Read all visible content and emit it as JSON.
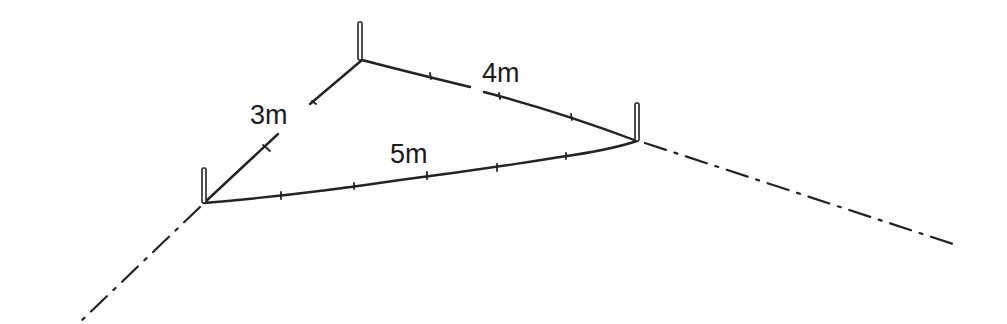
{
  "diagram": {
    "type": "3-4-5 right-angle layout triangle",
    "labels": {
      "side_a": "3m",
      "side_b": "4m",
      "side_c": "5m"
    },
    "stakes": [
      {
        "name": "stake-left",
        "x": 204,
        "y": 203
      },
      {
        "name": "stake-apex",
        "x": 362,
        "y": 60
      },
      {
        "name": "stake-right",
        "x": 637,
        "y": 141
      }
    ],
    "colors": {
      "ink": "#222222",
      "background": "#ffffff"
    }
  }
}
